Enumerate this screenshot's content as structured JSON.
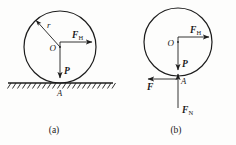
{
  "figure": {
    "type": "physics-free-body-diagram",
    "background_color": "#fdfdfc",
    "ink_color": "#1d1d1d",
    "panels": [
      {
        "id": "a",
        "caption": "(a)",
        "description": "Wheel resting on hatched ground with applied horizontal force and weight",
        "circle": {
          "cx": 60,
          "cy": 47,
          "r": 36
        },
        "center_label": "O",
        "radius_label": "r",
        "labels": {
          "force_horizontal": "F",
          "force_horizontal_sub": "H",
          "weight": "P",
          "contact_point": "A"
        },
        "ground": {
          "x1": 8,
          "x2": 113,
          "y": 83,
          "hatched": true
        }
      },
      {
        "id": "b",
        "caption": "(b)",
        "description": "Free body diagram of the wheel showing friction and normal reaction at contact point",
        "circle": {
          "cx": 178,
          "cy": 42,
          "r": 34
        },
        "center_label": "O",
        "labels": {
          "force_horizontal": "F",
          "force_horizontal_sub": "H",
          "weight": "P",
          "friction": "F",
          "normal": "F",
          "normal_sub": "N",
          "contact_point": "A"
        }
      }
    ]
  }
}
